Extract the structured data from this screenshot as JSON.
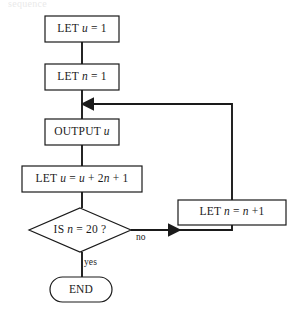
{
  "diagram": {
    "type": "flowchart",
    "title_fragment_clipped": "sequence",
    "stroke_color": "#1a1a1a",
    "fill_color": "#ffffff",
    "background_color": "#ffffff",
    "nodes": [
      {
        "id": "let-u-1",
        "shape": "rectangle",
        "label": "LET u = 1",
        "parts": [
          {
            "text": "LET ",
            "style": "roman"
          },
          {
            "text": "u",
            "style": "italic"
          },
          {
            "text": " = 1",
            "style": "roman"
          }
        ],
        "x": 45,
        "y": 16,
        "w": 74,
        "h": 26
      },
      {
        "id": "let-n-1",
        "shape": "rectangle",
        "label": "LET n = 1",
        "parts": [
          {
            "text": "LET ",
            "style": "roman"
          },
          {
            "text": "n",
            "style": "italic"
          },
          {
            "text": " = 1",
            "style": "roman"
          }
        ],
        "x": 45,
        "y": 64,
        "w": 74,
        "h": 26
      },
      {
        "id": "output-u",
        "shape": "rectangle",
        "label": "OUTPUT u",
        "parts": [
          {
            "text": "OUTPUT ",
            "style": "roman"
          },
          {
            "text": "u",
            "style": "italic"
          }
        ],
        "x": 45,
        "y": 119,
        "w": 74,
        "h": 26
      },
      {
        "id": "let-u-update",
        "shape": "rectangle",
        "label": "LET u = u + 2n + 1",
        "parts": [
          {
            "text": "LET ",
            "style": "roman"
          },
          {
            "text": "u",
            "style": "italic"
          },
          {
            "text": " = ",
            "style": "roman"
          },
          {
            "text": "u",
            "style": "italic"
          },
          {
            "text": " + 2",
            "style": "roman"
          },
          {
            "text": "n",
            "style": "italic"
          },
          {
            "text": " + 1",
            "style": "roman"
          }
        ],
        "x": 22,
        "y": 166,
        "w": 120,
        "h": 26
      },
      {
        "id": "is-n-20",
        "shape": "diamond",
        "label": "IS n = 20 ?",
        "parts": [
          {
            "text": "IS ",
            "style": "roman"
          },
          {
            "text": "n",
            "style": "italic"
          },
          {
            "text": " = 20 ?",
            "style": "roman"
          }
        ],
        "cx": 80,
        "cy": 230,
        "rx": 51,
        "ry": 22
      },
      {
        "id": "let-n-increment",
        "shape": "rectangle",
        "label": "LET n = n +1",
        "parts": [
          {
            "text": "LET ",
            "style": "roman"
          },
          {
            "text": "n",
            "style": "italic"
          },
          {
            "text": " = ",
            "style": "roman"
          },
          {
            "text": "n",
            "style": "italic"
          },
          {
            "text": " +1",
            "style": "roman"
          }
        ],
        "x": 178,
        "y": 200,
        "w": 108,
        "h": 25
      },
      {
        "id": "end",
        "shape": "stadium",
        "label": "END",
        "parts": [
          {
            "text": "END",
            "style": "roman"
          }
        ],
        "x": 50,
        "y": 277,
        "w": 62,
        "h": 25
      }
    ],
    "edge_labels": [
      {
        "id": "no-label",
        "text": "no",
        "x": 136,
        "y": 233
      },
      {
        "id": "yes-label",
        "text": "yes",
        "x": 84,
        "y": 260
      }
    ],
    "edges": [
      {
        "from": "let-u-1",
        "to": "let-n-1",
        "kind": "vertical",
        "arrow": false
      },
      {
        "from": "let-n-1",
        "to": "output-u",
        "kind": "vertical",
        "arrow": false
      },
      {
        "from": "output-u",
        "to": "let-u-update",
        "kind": "vertical",
        "arrow": false
      },
      {
        "from": "let-u-update",
        "to": "is-n-20",
        "kind": "vertical",
        "arrow": false
      },
      {
        "from": "is-n-20",
        "to": "end",
        "kind": "vertical",
        "arrow": false,
        "label": "yes"
      },
      {
        "from": "is-n-20",
        "to": "let-n-increment",
        "kind": "right-then-up",
        "arrow": true,
        "label": "no"
      },
      {
        "from": "let-n-increment",
        "to": "output-u",
        "kind": "up-then-left",
        "arrow": true
      }
    ]
  }
}
